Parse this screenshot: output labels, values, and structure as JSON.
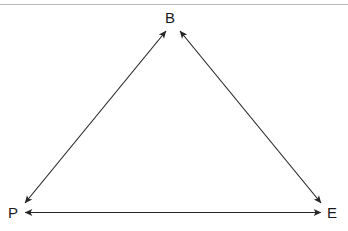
{
  "page": {
    "background_color": "#ffffff",
    "width": 348,
    "height": 231
  },
  "top_rule": {
    "color": "#b9babc"
  },
  "diagram": {
    "type": "triangle-relationship-diagram",
    "line_color": "#262626",
    "line_width": 1,
    "nodes": [
      {
        "id": "B",
        "label": "B",
        "x": 172,
        "y": 18,
        "position": "top"
      },
      {
        "id": "P",
        "label": "P",
        "x": 14,
        "y": 213,
        "position": "bottom-left"
      },
      {
        "id": "E",
        "label": "E",
        "x": 330,
        "y": 213,
        "position": "bottom-right"
      }
    ],
    "edges": [
      {
        "id": "P-B",
        "from": "P",
        "to": "B",
        "direction": "bidirectional",
        "style": "solid"
      },
      {
        "id": "B-E",
        "from": "B",
        "to": "E",
        "direction": "bidirectional",
        "style": "solid"
      },
      {
        "id": "P-E",
        "from": "P",
        "to": "E",
        "direction": "bidirectional",
        "style": "solid"
      }
    ]
  }
}
